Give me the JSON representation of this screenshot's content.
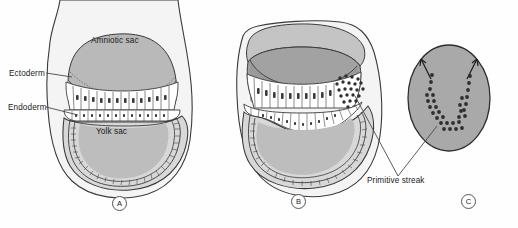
{
  "figure": {
    "background_color": "#fefefe",
    "panel_count": 3
  },
  "labels": {
    "ectoderm": "Ectoderm",
    "endoderm": "Endoderm",
    "amniotic_sac": "Amniotic sac",
    "yolk_sac": "Yolk sac",
    "primitive_streak": "Primitive streak"
  },
  "panel_tags": {
    "a": "A",
    "b": "B",
    "c": "C"
  },
  "caption": {
    "text": ""
  },
  "colors": {
    "outline": "#3a3a3a",
    "chorion_fill": "#f2f2f2",
    "amnion_fill": "#b9b9b9",
    "amnion_cavity_fill": "#a9a9a9",
    "yolk_fill": "#bdbdbd",
    "yolk_cavity_fill": "#d6d6d6",
    "cell_fill": "#ffffff",
    "nucleus_fill": "#3a3a3a",
    "disc_fill": "#a9a9a9",
    "streak_dot": "#2e2e2e",
    "leader_line": "#4a4a4a",
    "text": "#1a1a1a"
  },
  "panel_a": {
    "name": "Bilaminar embryo with intact amniotic sac",
    "structures": [
      "chorion",
      "amniotic sac",
      "ectoderm layer",
      "endoderm layer",
      "yolk sac"
    ]
  },
  "panel_b": {
    "name": "Embryo with amniotic sac opened showing primitive streak",
    "structures": [
      "chorion",
      "opened amniotic sac",
      "ectoderm layer",
      "endoderm layer",
      "yolk sac",
      "primitive streak cells"
    ]
  },
  "panel_c": {
    "name": "Surface view of embryonic disc with primitive streak",
    "structures": [
      "embryonic disc",
      "primitive streak dots",
      "migration arrows"
    ],
    "arrow_count": 2
  }
}
